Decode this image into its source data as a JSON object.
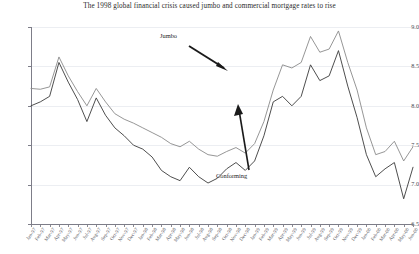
{
  "chart_data": {
    "type": "line",
    "title": "The 1998 global financial crisis caused jumbo and commercial mortgage rates to rise",
    "xlabel": "",
    "ylabel": "",
    "ylim": [
      6.5,
      9.0
    ],
    "yticks": [
      6.5,
      7.0,
      7.5,
      8.0,
      8.5,
      9.0
    ],
    "ytick_labels": [
      "6.5",
      "7.0",
      "7.5",
      "8.0",
      "8.5",
      "9.0"
    ],
    "grid": true,
    "legend_position": "annotations",
    "annotations": [
      {
        "text": "Jumbo",
        "points_to": "upper-series",
        "arrow": "down-right"
      },
      {
        "text": "Conforming",
        "points_to": "lower-series",
        "arrow": "up"
      }
    ],
    "categories": [
      "Jan-97",
      "Feb-97",
      "Mar-97",
      "Apr-97",
      "May-97",
      "Jun-97",
      "Jul-97",
      "Aug-97",
      "Sep-97",
      "Oct-97",
      "Nov-97",
      "Dec-97",
      "Jan-98",
      "Feb-98",
      "Mar-98",
      "Apr-98",
      "May-98",
      "Jun-98",
      "Jul-98",
      "Aug-98",
      "Sep-98",
      "Oct-98",
      "Nov-98",
      "Dec-98",
      "Jan-99",
      "Feb-99",
      "Mar-99",
      "Apr-99",
      "May-99",
      "Jun-99",
      "Jul-99",
      "Aug-99",
      "Sep-99",
      "Oct-99",
      "Nov-99",
      "Dec-99"
    ],
    "series": [
      {
        "name": "Jumbo",
        "values": [
          8.22,
          8.21,
          8.24,
          8.62,
          8.38,
          8.18,
          8.0,
          8.22,
          8.05,
          7.9,
          7.83,
          7.78,
          7.72,
          7.66,
          7.6,
          7.52,
          7.48,
          7.55,
          7.45,
          7.38,
          7.36,
          7.42,
          7.47,
          7.4,
          7.52,
          7.8,
          8.2,
          8.52,
          8.48,
          8.55,
          8.88,
          8.68,
          8.72,
          8.95,
          8.55,
          8.2
        ]
      },
      {
        "name": "Conforming",
        "values": [
          8.0,
          8.05,
          8.12,
          8.55,
          8.3,
          8.08,
          7.8,
          8.1,
          7.88,
          7.72,
          7.62,
          7.5,
          7.45,
          7.35,
          7.18,
          7.1,
          7.05,
          7.22,
          7.1,
          7.02,
          7.08,
          7.2,
          7.28,
          7.18,
          7.3,
          7.62,
          8.05,
          8.12,
          8.0,
          8.12,
          8.52,
          8.32,
          8.38,
          8.7,
          8.25,
          7.85
        ]
      }
    ],
    "series_tail": {
      "x_extra": [
        "Jan-00",
        "Feb-00",
        "Mar-00",
        "Apr-00",
        "May-00",
        "Jun-00"
      ],
      "jumbo_extra": [
        7.72,
        7.38,
        7.42,
        7.55,
        7.3,
        7.48
      ],
      "conforming_extra": [
        7.38,
        7.1,
        7.2,
        7.28,
        6.82,
        7.22
      ]
    },
    "colors": {
      "jumbo_line": "#8a8a8a",
      "conforming_line": "#3a3a3a",
      "axis": "#7d7d88",
      "grid": "#eceef2",
      "annotation_arrow": "#1a1a1a"
    }
  }
}
